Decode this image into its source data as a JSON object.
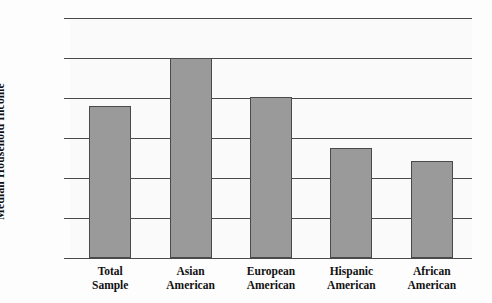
{
  "chart_data": {
    "type": "bar",
    "title": "",
    "xlabel": "",
    "ylabel": "Median Household Income",
    "categories": [
      "Total Sample",
      "Asian American",
      "European American",
      "Hispanic American",
      "African American"
    ],
    "category_lines": [
      [
        "Total",
        "Sample"
      ],
      [
        "Asian",
        "American"
      ],
      [
        "European",
        "American"
      ],
      [
        "Hispanic",
        "American"
      ],
      [
        "African",
        "American"
      ]
    ],
    "values": [
      38000,
      50000,
      40300,
      27500,
      24200
    ],
    "ylim": [
      0,
      60000
    ],
    "ytick_values": [
      0,
      10000,
      20000,
      30000,
      40000,
      50000,
      60000
    ],
    "ytick_labels": [
      "0",
      "10,000",
      "20,000",
      "30,000",
      "40,000",
      "50,000",
      "60,000"
    ],
    "grid": true,
    "legend": null,
    "bar_color": "#9a9a9a",
    "bar_edge_color": "#4a4a4a",
    "plot_background": "#fafafa"
  }
}
